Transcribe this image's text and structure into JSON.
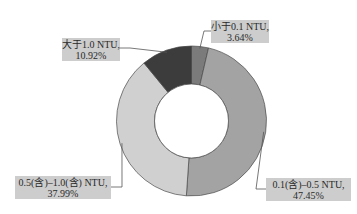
{
  "chart_data": {
    "type": "pie",
    "variant": "donut",
    "title": "",
    "start": "top",
    "direction": "clockwise",
    "slices": [
      {
        "label": "小于0.1 NTU,",
        "value": 3.64,
        "value_label": "3.64%",
        "color": "#7b7b7b"
      },
      {
        "label": "0.1(含)–0.5 NTU,",
        "value": 47.45,
        "value_label": "47.45%",
        "color": "#a3a3a3"
      },
      {
        "label": "0.5(含)–1.0(含) NTU,",
        "value": 37.99,
        "value_label": "37.99%",
        "color": "#d0d0d0"
      },
      {
        "label": "大于1.0 NTU,",
        "value": 10.92,
        "value_label": "10.92%",
        "color": "#3c3c3c"
      }
    ],
    "legend": "none",
    "data_labels": "outside-with-leader-lines"
  }
}
